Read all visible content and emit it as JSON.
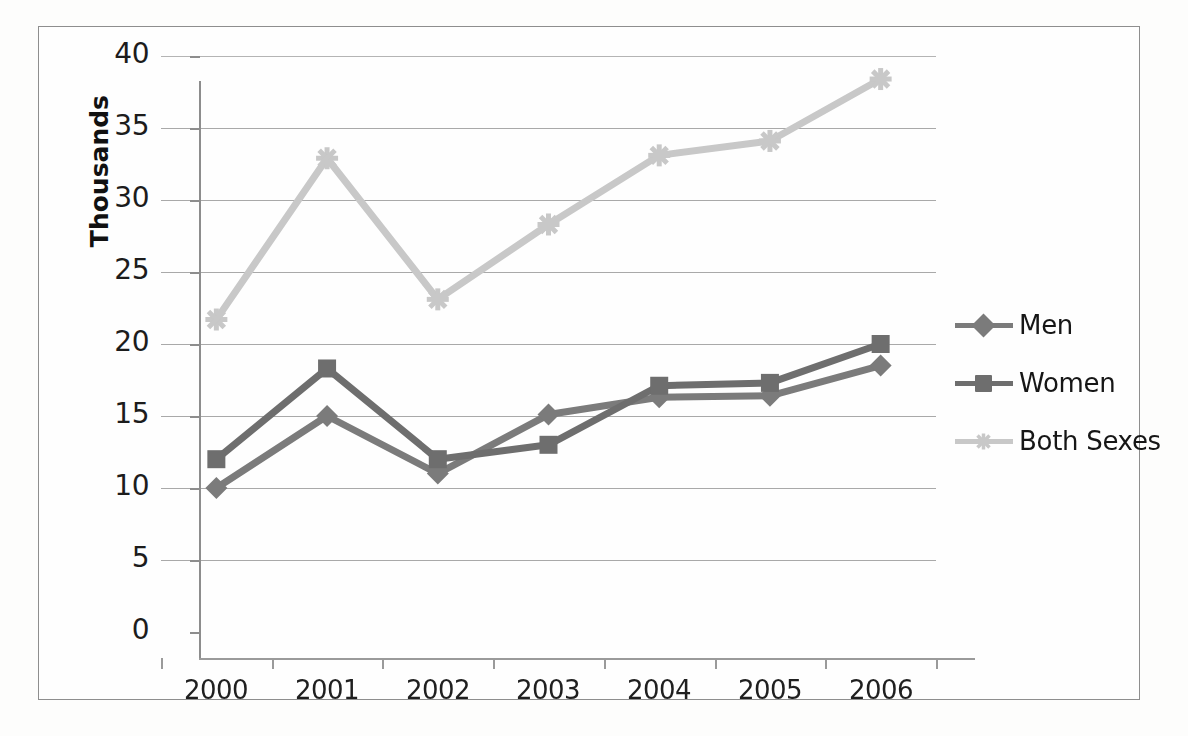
{
  "chart_data": {
    "type": "line",
    "title": "",
    "xlabel": "",
    "ylabel": "Thousands",
    "categories": [
      "2000",
      "2001",
      "2002",
      "2003",
      "2004",
      "2005",
      "2006"
    ],
    "ylim": [
      0,
      40
    ],
    "yticks": [
      "0",
      "5",
      "10",
      "15",
      "20",
      "25",
      "30",
      "35",
      "40"
    ],
    "grid": true,
    "legend_position": "right",
    "series": [
      {
        "name": "Men",
        "marker": "diamond",
        "color": "#7b7b7b",
        "values": [
          10.0,
          15.0,
          11.0,
          15.1,
          16.3,
          16.4,
          18.5
        ]
      },
      {
        "name": "Women",
        "marker": "square",
        "color": "#6e6e6e",
        "values": [
          12.0,
          18.3,
          12.0,
          13.0,
          17.1,
          17.3,
          20.0
        ]
      },
      {
        "name": "Both Sexes",
        "marker": "star",
        "color": "#c8c8c8",
        "values": [
          21.7,
          32.9,
          23.1,
          28.3,
          33.1,
          34.1,
          38.4
        ]
      }
    ]
  },
  "axis": {
    "y_title": "Thousands"
  },
  "legend": {
    "items": [
      {
        "label": "Men"
      },
      {
        "label": "Women"
      },
      {
        "label": "Both Sexes"
      }
    ]
  },
  "colors": {
    "men": "#7b7b7b",
    "women": "#6e6e6e",
    "both_sexes": "#c8c8c8",
    "gridline": "#a9a9a9",
    "axis": "#8d8d8d",
    "text": "#1c1c1c",
    "frame": "#8e8e8e"
  }
}
